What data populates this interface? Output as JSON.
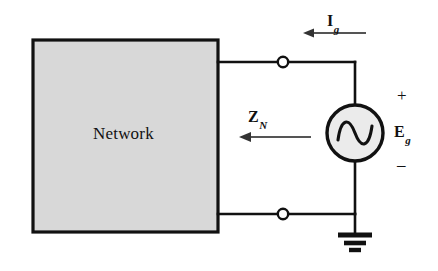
{
  "figure": {
    "type": "circuit-diagram",
    "background_color": "#ffffff",
    "line_color": "#111111"
  },
  "network_block": {
    "label": "Network",
    "fill_color": "#d8d8d8",
    "border_color": "#111111",
    "x": 33,
    "y": 40,
    "width": 185,
    "height": 192
  },
  "labels": {
    "current": {
      "symbol": "I",
      "subscript": "g",
      "full": "Ig",
      "x": 327,
      "y": 14
    },
    "impedance": {
      "symbol": "Z",
      "subscript": "N",
      "full": "ZN",
      "x": 248,
      "y": 110
    },
    "voltage": {
      "symbol": "E",
      "subscript": "g",
      "full": "Eg",
      "x": 393,
      "y": 124
    },
    "plus_sign": "+",
    "minus_sign": "–"
  },
  "source": {
    "kind": "ac-voltage-source",
    "glyph": "sine",
    "center_x": 355,
    "center_y": 133,
    "radius": 28,
    "fill_color": "#ebebeb"
  },
  "terminals": [
    {
      "name": "top-terminal",
      "x": 283,
      "y": 62,
      "radius": 5
    },
    {
      "name": "bottom-terminal",
      "x": 283,
      "y": 214,
      "radius": 5
    }
  ],
  "ground": {
    "name": "ground-symbol",
    "x": 355,
    "y": 233,
    "bar_widths": [
      34,
      22,
      12
    ]
  },
  "arrows": {
    "current_arrow": {
      "direction": "left",
      "from_x": 366,
      "to_x": 304,
      "y": 33
    },
    "impedance_arrow": {
      "direction": "left",
      "from_x": 311,
      "to_x": 240,
      "y": 137
    }
  }
}
